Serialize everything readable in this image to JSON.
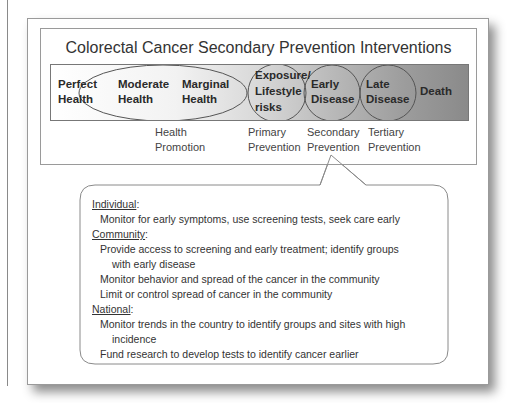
{
  "diagram": {
    "title": "Colorectal Cancer Secondary Prevention Interventions",
    "stages": [
      {
        "line1": "Perfect",
        "line2": "Health"
      },
      {
        "line1": "Moderate",
        "line2": "Health"
      },
      {
        "line1": "Marginal",
        "line2": "Health"
      },
      {
        "line1": "Exposure/",
        "line2": "Lifestyle",
        "line3": "risks"
      },
      {
        "line1": "Early",
        "line2": "Disease"
      },
      {
        "line1": "Late",
        "line2": "Disease"
      },
      {
        "line1": "Death"
      }
    ],
    "prevention_levels": [
      {
        "line1": "Health",
        "line2": "Promotion"
      },
      {
        "line1": "Primary",
        "line2": "Prevention"
      },
      {
        "line1": "Secondary",
        "line2": "Prevention"
      },
      {
        "line1": "Tertiary",
        "line2": "Prevention"
      }
    ],
    "colors": {
      "bar_start": "#ffffff",
      "bar_end": "#8a8a8a",
      "outline": "#555555"
    }
  },
  "callout": {
    "sections": [
      {
        "heading": "Individual",
        "items": [
          {
            "text": "Monitor for early symptoms, use screening tests, seek care early"
          }
        ]
      },
      {
        "heading": "Community",
        "items": [
          {
            "text": "Provide access to screening and early treatment; identify groups",
            "cont": "with early disease"
          },
          {
            "text": "Monitor behavior and spread of the cancer in the community"
          },
          {
            "text": "Limit or control spread of cancer in the community"
          }
        ]
      },
      {
        "heading": "National",
        "items": [
          {
            "text": "Monitor trends in the country to identify groups and sites with high",
            "cont": "incidence"
          },
          {
            "text": "Fund research to develop tests to identify cancer earlier"
          }
        ]
      }
    ],
    "colon": ":"
  }
}
